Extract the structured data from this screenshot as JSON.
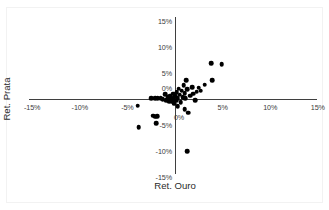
{
  "chart_data": {
    "type": "scatter",
    "title": "",
    "xlabel": "Ret. Ouro",
    "ylabel": "Ret. Prata",
    "xlim": [
      -15,
      15
    ],
    "ylim": [
      -15,
      15
    ],
    "grid": false,
    "legend": null,
    "xticks": [
      -15,
      -10,
      -5,
      0,
      5,
      10,
      15
    ],
    "yticks": [
      -15,
      -10,
      -5,
      0,
      5,
      10,
      15
    ],
    "xtick_labels": [
      "-15%",
      "-10%",
      "-5%",
      "0%",
      "5%",
      "10%",
      "15%"
    ],
    "ytick_labels": [
      "-15%",
      "-10%",
      "-5%",
      "0%",
      "5%",
      "10%",
      "15%"
    ],
    "marker": "filled-circle",
    "marker_color": "#000000",
    "axis_color": "#3f3f3f",
    "background_color": "#ffffff",
    "points": [
      {
        "x": -3.9,
        "y": -1.3
      },
      {
        "x": -3.8,
        "y": -5.4
      },
      {
        "x": -2.3,
        "y": -3.2
      },
      {
        "x": -2.1,
        "y": -3.4
      },
      {
        "x": -1.9,
        "y": -3.3
      },
      {
        "x": -2.0,
        "y": -4.6
      },
      {
        "x": -2.5,
        "y": 0.1
      },
      {
        "x": -2.1,
        "y": 0.1
      },
      {
        "x": -1.8,
        "y": 0.2
      },
      {
        "x": -1.5,
        "y": 0.1
      },
      {
        "x": -1.3,
        "y": 0.0
      },
      {
        "x": -1.0,
        "y": 0.9
      },
      {
        "x": -0.9,
        "y": -0.2
      },
      {
        "x": -0.7,
        "y": 0.3
      },
      {
        "x": -0.6,
        "y": -0.4
      },
      {
        "x": -0.5,
        "y": 0.6
      },
      {
        "x": -0.4,
        "y": 0.2
      },
      {
        "x": -0.3,
        "y": -0.5
      },
      {
        "x": -0.2,
        "y": 1.0
      },
      {
        "x": -0.2,
        "y": 0.0
      },
      {
        "x": -0.1,
        "y": -0.9
      },
      {
        "x": 0.0,
        "y": 0.5
      },
      {
        "x": 0.1,
        "y": -0.3
      },
      {
        "x": 0.2,
        "y": 1.3
      },
      {
        "x": 0.3,
        "y": 0.2
      },
      {
        "x": 0.3,
        "y": -1.4
      },
      {
        "x": 0.4,
        "y": 2.0
      },
      {
        "x": 0.5,
        "y": 0.8
      },
      {
        "x": 0.6,
        "y": -0.6
      },
      {
        "x": 0.7,
        "y": 1.6
      },
      {
        "x": 0.8,
        "y": 0.4
      },
      {
        "x": 0.9,
        "y": 2.6
      },
      {
        "x": 1.0,
        "y": 1.1
      },
      {
        "x": 1.0,
        "y": -1.9
      },
      {
        "x": 1.1,
        "y": 0.2
      },
      {
        "x": 1.2,
        "y": 3.6
      },
      {
        "x": 1.3,
        "y": 1.9
      },
      {
        "x": 1.4,
        "y": -2.6
      },
      {
        "x": 1.6,
        "y": 0.6
      },
      {
        "x": 1.8,
        "y": 2.3
      },
      {
        "x": 1.9,
        "y": 1.0
      },
      {
        "x": 2.1,
        "y": -0.2
      },
      {
        "x": 2.3,
        "y": 1.4
      },
      {
        "x": 2.5,
        "y": 2.2
      },
      {
        "x": 2.7,
        "y": 1.6
      },
      {
        "x": 3.1,
        "y": 2.7
      },
      {
        "x": 3.9,
        "y": 3.6
      },
      {
        "x": 3.8,
        "y": 6.9
      },
      {
        "x": 4.9,
        "y": 6.7
      },
      {
        "x": 1.3,
        "y": -10.0
      }
    ]
  },
  "axis_titles": {
    "x": "Ret. Ouro",
    "y": "Ret. Prata"
  }
}
